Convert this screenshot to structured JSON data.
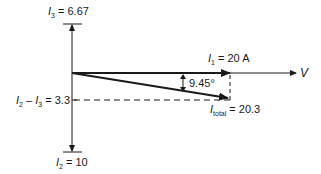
{
  "diagram": {
    "type": "phasor",
    "labels": {
      "i3": {
        "sym": "I",
        "sub": "3",
        "value": " = 6.67"
      },
      "i2": {
        "sym": "I",
        "sub": "2",
        "value": " = 10"
      },
      "diff": {
        "sym1": "I",
        "sub1": "2",
        "mid": " – ",
        "sym2": "I",
        "sub2": "3",
        "value": " = 3.3"
      },
      "i1": {
        "sym": "I",
        "sub": "1",
        "value": " = 20 A"
      },
      "total": {
        "sym": "I",
        "sub": "total",
        "value": " = 20.3"
      },
      "angle": "9.45°",
      "v": "V"
    },
    "colors": {
      "line": "#1a1a1a"
    }
  }
}
